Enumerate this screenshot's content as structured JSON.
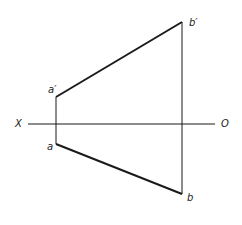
{
  "diagram": {
    "type": "orthographic-projection",
    "axis": {
      "left_label": "X",
      "right_label": "O",
      "y": 124,
      "x_start": 28,
      "x_end": 215
    },
    "points": [
      {
        "name": "a_prime",
        "label": "a′",
        "x": 56,
        "y": 97
      },
      {
        "name": "a",
        "label": "a",
        "x": 56,
        "y": 144
      },
      {
        "name": "b_prime",
        "label": "b′",
        "x": 182,
        "y": 22
      },
      {
        "name": "b",
        "label": "b",
        "x": 182,
        "y": 194
      }
    ],
    "lines": [
      {
        "name": "front-view-ab",
        "from": "a_prime",
        "to": "b_prime",
        "weight": "thick"
      },
      {
        "name": "top-view-ab",
        "from": "a",
        "to": "b",
        "weight": "thick"
      },
      {
        "name": "projector-a",
        "from": "a_prime",
        "to": "a",
        "weight": "thin"
      },
      {
        "name": "projector-b",
        "from": "b_prime",
        "to": "b",
        "weight": "thin"
      }
    ],
    "colors": {
      "line": "#1a1a1a",
      "background": "#ffffff"
    }
  }
}
